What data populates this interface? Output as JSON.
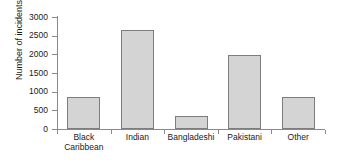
{
  "chart_data": {
    "type": "bar",
    "title": "",
    "xlabel": "",
    "ylabel": "Number of incidents",
    "categories": [
      "Black\nCaribbean",
      "Indian",
      "Bangladeshi",
      "Pakistani",
      "Other"
    ],
    "values": [
      870,
      2650,
      340,
      1990,
      850
    ],
    "ylim": [
      0,
      3000
    ],
    "yticks": [
      0,
      500,
      1000,
      1500,
      2000,
      2500,
      3000
    ],
    "ytick_labels": [
      "0",
      "500",
      "1000",
      "1500",
      "2000",
      "2500",
      "3000"
    ],
    "grid": false,
    "legend": null,
    "bar_fill_color": "#d4d4d4",
    "bar_border_color": "#7d7d7d",
    "axis_color": "#8a8a8a",
    "background_color": "#ffffff",
    "text_color": "#1a1a1a"
  }
}
